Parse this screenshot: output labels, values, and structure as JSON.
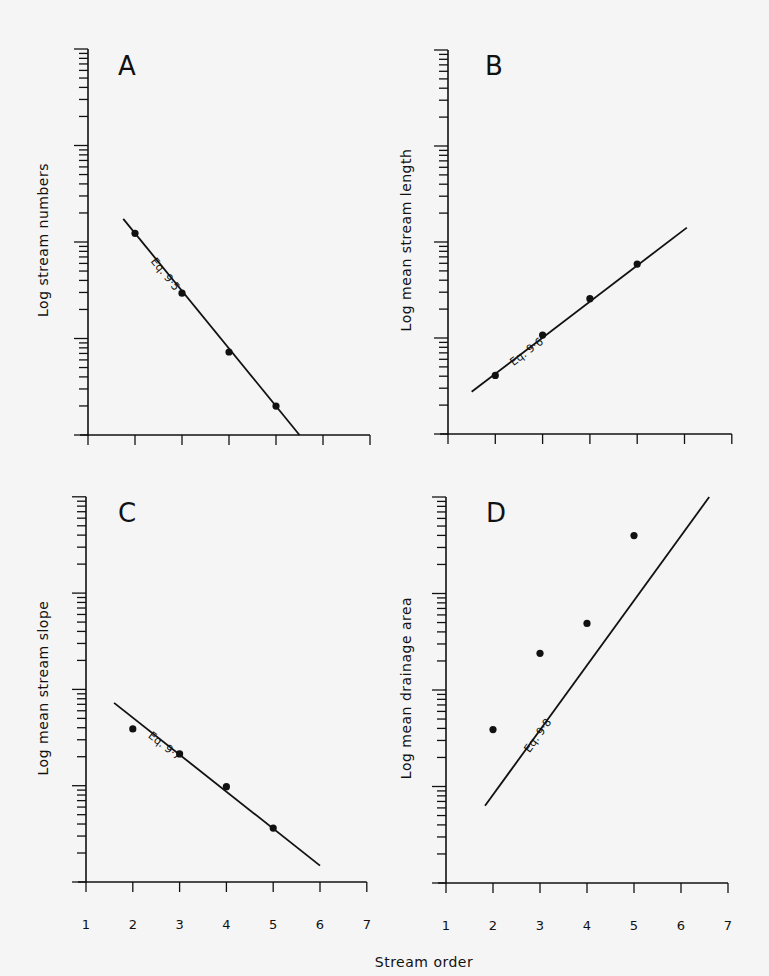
{
  "figure": {
    "shared_xlabel": "Stream order"
  },
  "chart_data": [
    {
      "type": "scatter",
      "panel": "A",
      "ylabel": "Log stream numbers",
      "xlabel": "",
      "x_ticks": [
        "1",
        "2",
        "3",
        "4",
        "5",
        "6",
        "7"
      ],
      "xlim": [
        1,
        7
      ],
      "y_scale": "log",
      "ylim_log_decades": [
        0,
        4
      ],
      "grid": false,
      "points": [
        {
          "x": 2,
          "log_y": 2.09
        },
        {
          "x": 3,
          "log_y": 1.47
        },
        {
          "x": 4,
          "log_y": 0.86
        },
        {
          "x": 5,
          "log_y": 0.3
        }
      ],
      "fit_line": {
        "label": "Eq. 9·5",
        "x": [
          1.75,
          5.5
        ],
        "log_y": [
          2.24,
          0.0
        ]
      }
    },
    {
      "type": "scatter",
      "panel": "B",
      "ylabel": "Log mean stream length",
      "xlabel": "",
      "x_ticks": [
        "1",
        "2",
        "3",
        "4",
        "5",
        "6",
        "7"
      ],
      "xlim": [
        1,
        7
      ],
      "y_scale": "log",
      "ylim_log_decades": [
        0,
        4
      ],
      "grid": false,
      "points": [
        {
          "x": 2,
          "log_y": 0.61
        },
        {
          "x": 3,
          "log_y": 1.03
        },
        {
          "x": 4,
          "log_y": 1.41
        },
        {
          "x": 5,
          "log_y": 1.77
        }
      ],
      "fit_line": {
        "label": "Eq. 9·6",
        "x": [
          1.5,
          6.05
        ],
        "log_y": [
          0.44,
          2.15
        ]
      }
    },
    {
      "type": "scatter",
      "panel": "C",
      "ylabel": "Log mean stream slope",
      "xlabel": "Stream order",
      "x_ticks": [
        "1",
        "2",
        "3",
        "4",
        "5",
        "6",
        "7"
      ],
      "xlim": [
        1,
        7
      ],
      "y_scale": "log",
      "ylim_log_decades": [
        0,
        4
      ],
      "grid": false,
      "points": [
        {
          "x": 2,
          "log_y": 1.59
        },
        {
          "x": 3,
          "log_y": 1.33
        },
        {
          "x": 4,
          "log_y": 0.99
        },
        {
          "x": 5,
          "log_y": 0.56
        }
      ],
      "fit_line": {
        "label": "Eq. 9·7",
        "x": [
          1.6,
          6.0
        ],
        "log_y": [
          1.86,
          0.17
        ]
      }
    },
    {
      "type": "scatter",
      "panel": "D",
      "ylabel": "Log mean drainage area",
      "xlabel": "Stream order",
      "x_ticks": [
        "1",
        "2",
        "3",
        "4",
        "5",
        "6",
        "7"
      ],
      "xlim": [
        1,
        7
      ],
      "y_scale": "log",
      "ylim_log_decades": [
        0,
        4
      ],
      "grid": false,
      "points": [
        {
          "x": 2,
          "log_y": 1.59
        },
        {
          "x": 3,
          "log_y": 2.38
        },
        {
          "x": 4,
          "log_y": 2.69
        },
        {
          "x": 5,
          "log_y": 3.6
        }
      ],
      "fit_line": {
        "label": "Eq. 9·8",
        "x": [
          1.83,
          6.6
        ],
        "log_y": [
          0.8,
          4.0
        ]
      }
    }
  ]
}
